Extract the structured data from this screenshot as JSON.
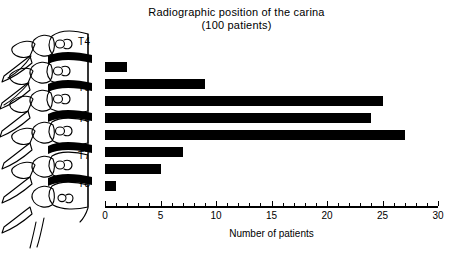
{
  "figure": {
    "title_line1": "Radiographic position of the carina",
    "title_line2": "(100 patients)"
  },
  "vertebra_labels": [
    {
      "label": "T4",
      "x": 78,
      "y": 36
    },
    {
      "label": "T5",
      "x": 78,
      "y": 82
    },
    {
      "label": "T6",
      "x": 78,
      "y": 113
    },
    {
      "label": "T7",
      "x": 78,
      "y": 150
    },
    {
      "label": "T8",
      "x": 78,
      "y": 178
    }
  ],
  "axis": {
    "x_title": "Number of patients",
    "tick_labels": [
      "0",
      "5",
      "10",
      "15",
      "20",
      "25",
      "30"
    ],
    "tick_values": [
      0,
      5,
      10,
      15,
      20,
      25,
      30
    ],
    "minor_step": 1,
    "min": 0,
    "max": 30
  },
  "bar_color": "#000000",
  "chart_data": {
    "type": "bar",
    "orientation": "horizontal",
    "title": "Radiographic position of the carina (100 patients)",
    "xlabel": "Number of patients",
    "ylabel": "",
    "xlim": [
      0,
      30
    ],
    "grid": false,
    "legend": false,
    "categories": [
      "T4 body",
      "T4-T5 disc",
      "T5 body",
      "T5-T6 disc",
      "T6 body",
      "T6-T7 disc",
      "T7 body",
      "T7-T8 disc"
    ],
    "values": [
      2,
      9,
      25,
      24,
      27,
      7,
      5,
      1
    ],
    "tick_labels": [
      "0",
      "5",
      "10",
      "15",
      "20",
      "25",
      "30"
    ]
  }
}
